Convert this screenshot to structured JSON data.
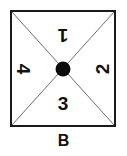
{
  "figure": {
    "caption": "B",
    "shape": "square",
    "center_marker": "filled-dot",
    "colors": {
      "border": "#1a1a1a",
      "diagonal": "#6e6e6e",
      "dot": "#0b0b0b",
      "text": "#121212",
      "background": "#ffffff"
    },
    "quadrants": [
      {
        "id": "top",
        "label": "1",
        "rotation_deg": 180
      },
      {
        "id": "right",
        "label": "2",
        "rotation_deg": -90
      },
      {
        "id": "bottom",
        "label": "3",
        "rotation_deg": 0
      },
      {
        "id": "left",
        "label": "4",
        "rotation_deg": 90
      }
    ]
  }
}
